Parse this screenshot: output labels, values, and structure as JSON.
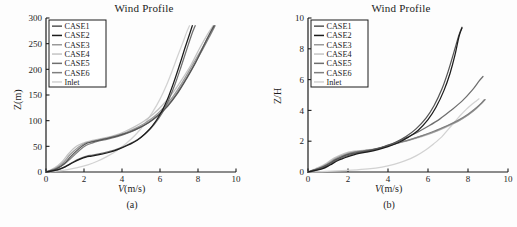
{
  "figure": {
    "caption_a": "(a)",
    "caption_b": "(b)"
  },
  "panels": [
    {
      "id": "a",
      "title": "Wind Profile",
      "xlabel_italic": "V",
      "xlabel_rest": "(m/s)",
      "ylabel_italic": "Z",
      "ylabel_rest": "(m)",
      "caption": "(a)"
    },
    {
      "id": "b",
      "title": "Wind Profile",
      "xlabel_italic": "V",
      "xlabel_rest": "(m/s)",
      "ylabel_italic": "Z/H",
      "ylabel_rest": "",
      "caption": "(b)"
    }
  ],
  "legend": {
    "items": [
      {
        "label": "CASE1",
        "color": "#555555"
      },
      {
        "label": "CASE2",
        "color": "#1c1c1c"
      },
      {
        "label": "CASE3",
        "color": "#9a9a9a"
      },
      {
        "label": "CASE4",
        "color": "#c4c4c4"
      },
      {
        "label": "CASE5",
        "color": "#6e6e6e"
      },
      {
        "label": "CASE6",
        "color": "#7f7f7f"
      },
      {
        "label": "Inlet",
        "color": "#d2d2d2"
      }
    ]
  },
  "chart_data": [
    {
      "type": "line",
      "panel": "a",
      "title": "Wind Profile",
      "xlabel": "V(m/s)",
      "ylabel": "Z(m)",
      "xlim": [
        0,
        10
      ],
      "ylim": [
        0,
        300
      ],
      "xticks": [
        0,
        2,
        4,
        6,
        8,
        10
      ],
      "yticks": [
        0,
        50,
        100,
        150,
        200,
        250,
        300
      ],
      "grid": false,
      "legend_position": "upper-left",
      "note": "x = wind speed V in m/s, y = height Z in metres. Series are vertical wind profiles.",
      "series": [
        {
          "name": "CASE1",
          "color": "#555555",
          "x": [
            0.0,
            0.55,
            0.95,
            1.3,
            1.75,
            2.1,
            2.35,
            2.6,
            2.95,
            3.4,
            3.9,
            4.4,
            4.9,
            5.4,
            5.9,
            6.4,
            6.9,
            7.4,
            7.9,
            8.35,
            8.7,
            8.85
          ],
          "y": [
            0,
            6,
            16,
            30,
            46,
            55,
            58,
            60,
            63,
            67,
            72,
            78,
            86,
            96,
            110,
            128,
            152,
            182,
            215,
            250,
            275,
            285
          ]
        },
        {
          "name": "CASE2",
          "color": "#1c1c1c",
          "x": [
            0.0,
            0.6,
            1.0,
            1.4,
            1.8,
            2.1,
            2.4,
            2.8,
            3.3,
            3.8,
            4.3,
            4.8,
            5.2,
            5.6,
            6.0,
            6.35,
            6.7,
            7.0,
            7.3,
            7.55,
            7.7
          ],
          "y": [
            0,
            4,
            10,
            18,
            25,
            29,
            31,
            34,
            38,
            44,
            52,
            62,
            74,
            90,
            112,
            138,
            172,
            205,
            240,
            268,
            285
          ]
        },
        {
          "name": "CASE3",
          "color": "#9a9a9a",
          "x": [
            0.0,
            0.5,
            0.9,
            1.25,
            1.7,
            2.05,
            2.35,
            2.7,
            3.2,
            3.7,
            4.2,
            4.7,
            5.2,
            5.7,
            6.2,
            6.7,
            7.2,
            7.7,
            8.2,
            8.6,
            8.85
          ],
          "y": [
            0,
            7,
            18,
            33,
            48,
            56,
            59,
            62,
            66,
            71,
            77,
            85,
            95,
            108,
            126,
            148,
            176,
            208,
            240,
            268,
            285
          ]
        },
        {
          "name": "CASE4",
          "color": "#c4c4c4",
          "x": [
            0.0,
            0.45,
            0.85,
            1.2,
            1.6,
            2.0,
            2.3,
            2.65,
            3.15,
            3.65,
            4.15,
            4.65,
            5.15,
            5.65,
            6.15,
            6.65,
            7.15,
            7.65,
            8.1,
            8.5,
            8.8
          ],
          "y": [
            0,
            8,
            20,
            36,
            50,
            57,
            60,
            63,
            67,
            72,
            79,
            88,
            99,
            113,
            131,
            153,
            180,
            210,
            242,
            268,
            285
          ]
        },
        {
          "name": "CASE5",
          "color": "#6e6e6e",
          "x": [
            0.0,
            0.6,
            1.05,
            1.45,
            1.85,
            2.15,
            2.45,
            2.85,
            3.35,
            3.85,
            4.35,
            4.85,
            5.3,
            5.7,
            6.1,
            6.45,
            6.8,
            7.1,
            7.4,
            7.65,
            7.85
          ],
          "y": [
            0,
            4,
            11,
            20,
            27,
            31,
            33,
            36,
            40,
            46,
            54,
            64,
            77,
            93,
            114,
            140,
            172,
            204,
            238,
            266,
            285
          ]
        },
        {
          "name": "CASE6",
          "color": "#7f7f7f",
          "x": [
            0.0,
            0.55,
            0.95,
            1.35,
            1.78,
            2.12,
            2.4,
            2.75,
            3.25,
            3.75,
            4.25,
            4.75,
            5.25,
            5.75,
            6.25,
            6.75,
            7.25,
            7.75,
            8.25,
            8.65,
            8.9
          ],
          "y": [
            0,
            6,
            15,
            28,
            43,
            52,
            56,
            60,
            64,
            69,
            75,
            83,
            93,
            106,
            124,
            146,
            174,
            206,
            239,
            267,
            285
          ]
        },
        {
          "name": "Inlet",
          "color": "#d2d2d2",
          "x": [
            0.0,
            0.9,
            1.6,
            2.2,
            2.7,
            3.2,
            3.7,
            4.2,
            4.7,
            5.2,
            5.6,
            6.0,
            6.35,
            6.65,
            6.95,
            7.2,
            7.4,
            7.55
          ],
          "y": [
            0,
            3,
            8,
            14,
            21,
            30,
            41,
            55,
            72,
            94,
            116,
            142,
            170,
            198,
            228,
            252,
            272,
            285
          ]
        }
      ]
    },
    {
      "type": "line",
      "panel": "b",
      "title": "Wind Profile",
      "xlabel": "V(m/s)",
      "ylabel": "Z/H",
      "xlim": [
        0,
        10
      ],
      "ylim": [
        0,
        10
      ],
      "xticks": [
        0,
        2,
        4,
        6,
        8,
        10
      ],
      "yticks": [
        0,
        2,
        4,
        6,
        8,
        10
      ],
      "grid": false,
      "legend_position": "upper-left",
      "note": "x = wind speed V in m/s, y = normalised height Z/H (dimensionless).",
      "series": [
        {
          "name": "CASE1",
          "color": "#555555",
          "x": [
            0.0,
            0.6,
            1.0,
            1.4,
            1.9,
            2.4,
            2.9,
            3.4,
            3.9,
            4.4,
            4.9,
            5.4,
            5.9,
            6.3,
            6.7,
            7.0,
            7.3,
            7.55,
            7.7
          ],
          "y": [
            0.0,
            0.25,
            0.5,
            0.8,
            1.1,
            1.25,
            1.35,
            1.5,
            1.7,
            1.95,
            2.3,
            2.8,
            3.5,
            4.3,
            5.4,
            6.5,
            7.8,
            8.9,
            9.4
          ]
        },
        {
          "name": "CASE2",
          "color": "#1c1c1c",
          "x": [
            0.0,
            0.7,
            1.1,
            1.5,
            2.0,
            2.5,
            3.0,
            3.5,
            4.0,
            4.5,
            5.0,
            5.5,
            6.0,
            6.4,
            6.8,
            7.1,
            7.35,
            7.55,
            7.7
          ],
          "y": [
            0.0,
            0.2,
            0.45,
            0.75,
            1.0,
            1.2,
            1.3,
            1.45,
            1.65,
            1.9,
            2.25,
            2.7,
            3.4,
            4.2,
            5.3,
            6.4,
            7.6,
            8.8,
            9.35
          ]
        },
        {
          "name": "CASE3",
          "color": "#9a9a9a",
          "x": [
            0.0,
            0.55,
            0.95,
            1.35,
            1.85,
            2.35,
            2.9,
            3.45,
            4.0,
            4.55,
            5.1,
            5.7,
            6.3,
            6.9,
            7.5,
            8.0,
            8.4,
            8.7,
            8.85
          ],
          "y": [
            0.0,
            0.25,
            0.52,
            0.85,
            1.15,
            1.3,
            1.4,
            1.5,
            1.7,
            1.9,
            2.1,
            2.35,
            2.6,
            2.95,
            3.3,
            3.7,
            4.1,
            4.5,
            4.7
          ]
        },
        {
          "name": "CASE4",
          "color": "#c4c4c4",
          "x": [
            0.0,
            0.5,
            0.9,
            1.3,
            1.8,
            2.3,
            2.85,
            3.4,
            3.95,
            4.5,
            5.05,
            5.65,
            6.25,
            6.85,
            7.45,
            7.95,
            8.35,
            8.65,
            8.8
          ],
          "y": [
            0.0,
            0.28,
            0.55,
            0.9,
            1.2,
            1.35,
            1.42,
            1.52,
            1.7,
            1.88,
            2.05,
            2.28,
            2.55,
            2.88,
            3.25,
            3.65,
            4.05,
            4.45,
            4.7
          ]
        },
        {
          "name": "CASE5",
          "color": "#6e6e6e",
          "x": [
            0.0,
            0.65,
            1.05,
            1.45,
            1.95,
            2.45,
            2.95,
            3.45,
            3.95,
            4.45,
            4.95,
            5.5,
            6.05,
            6.6,
            7.15,
            7.7,
            8.2,
            8.55,
            8.75
          ],
          "y": [
            0.0,
            0.22,
            0.48,
            0.78,
            1.05,
            1.22,
            1.32,
            1.48,
            1.7,
            1.95,
            2.25,
            2.6,
            3.0,
            3.45,
            4.0,
            4.6,
            5.3,
            5.9,
            6.2
          ]
        },
        {
          "name": "CASE6",
          "color": "#7f7f7f",
          "x": [
            0.0,
            0.6,
            1.0,
            1.4,
            1.9,
            2.4,
            2.95,
            3.5,
            4.05,
            4.6,
            5.15,
            5.75,
            6.35,
            6.95,
            7.5,
            8.0,
            8.4,
            8.7,
            8.85
          ],
          "y": [
            0.0,
            0.25,
            0.5,
            0.82,
            1.12,
            1.3,
            1.4,
            1.52,
            1.72,
            1.92,
            2.12,
            2.38,
            2.68,
            3.0,
            3.35,
            3.75,
            4.15,
            4.5,
            4.7
          ]
        },
        {
          "name": "Inlet",
          "color": "#d2d2d2",
          "x": [
            0.0,
            1.2,
            2.2,
            3.0,
            3.7,
            4.3,
            4.9,
            5.4,
            5.9,
            6.3,
            6.7,
            7.0,
            7.3,
            7.6,
            7.9,
            8.2,
            8.4,
            8.55
          ],
          "y": [
            0.0,
            0.05,
            0.12,
            0.2,
            0.32,
            0.5,
            0.75,
            1.05,
            1.45,
            1.85,
            2.3,
            2.75,
            3.2,
            3.65,
            4.05,
            4.4,
            4.6,
            4.75
          ]
        }
      ]
    }
  ]
}
